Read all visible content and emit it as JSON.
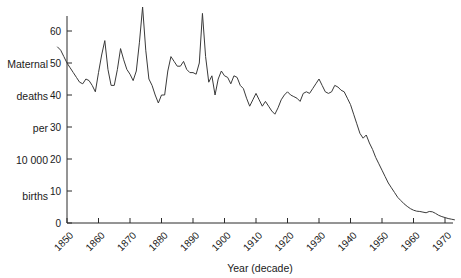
{
  "chart_data": {
    "type": "line",
    "title": "",
    "xlabel": "Year (decade)",
    "ylabel": "Maternal deaths per 10 000 births",
    "ylabel_lines": [
      "Maternal",
      "deaths",
      "per",
      "10 000",
      "births"
    ],
    "xlim": [
      1847,
      1973
    ],
    "ylim": [
      0,
      68
    ],
    "grid": false,
    "legend": "none",
    "line_color": "#3a3a3a",
    "axis_color": "#2b2b2b",
    "xticks": [
      1850,
      1860,
      1870,
      1880,
      1890,
      1900,
      1910,
      1920,
      1930,
      1940,
      1950,
      1960,
      1970
    ],
    "xtick_labels": [
      "1850",
      "1860",
      "1870",
      "1880",
      "1890",
      "1900",
      "1910",
      "1920",
      "1930",
      "1940",
      "1950",
      "1960",
      "1970"
    ],
    "xtick_rotation": 45,
    "yticks": [
      0,
      10,
      20,
      30,
      40,
      50,
      60
    ],
    "ytick_labels": [
      "0",
      "10",
      "20",
      "30",
      "40",
      "50",
      "60"
    ],
    "series": [
      {
        "name": "Maternal deaths per 10 000 births",
        "x": [
          1847,
          1848,
          1849,
          1850,
          1851,
          1852,
          1853,
          1854,
          1855,
          1856,
          1857,
          1858,
          1859,
          1860,
          1861,
          1862,
          1863,
          1864,
          1865,
          1866,
          1867,
          1868,
          1869,
          1870,
          1871,
          1872,
          1873,
          1874,
          1875,
          1876,
          1877,
          1878,
          1879,
          1880,
          1881,
          1882,
          1883,
          1884,
          1885,
          1886,
          1887,
          1888,
          1889,
          1890,
          1891,
          1892,
          1893,
          1894,
          1895,
          1896,
          1897,
          1898,
          1899,
          1900,
          1901,
          1902,
          1903,
          1904,
          1905,
          1906,
          1907,
          1908,
          1909,
          1910,
          1911,
          1912,
          1913,
          1914,
          1915,
          1916,
          1917,
          1918,
          1919,
          1920,
          1921,
          1922,
          1923,
          1924,
          1925,
          1926,
          1927,
          1928,
          1929,
          1930,
          1931,
          1932,
          1933,
          1934,
          1935,
          1936,
          1937,
          1938,
          1939,
          1940,
          1941,
          1942,
          1943,
          1944,
          1945,
          1946,
          1947,
          1948,
          1949,
          1950,
          1951,
          1952,
          1953,
          1954,
          1955,
          1956,
          1957,
          1958,
          1959,
          1960,
          1961,
          1962,
          1963,
          1964,
          1965,
          1966,
          1967,
          1968,
          1969,
          1970,
          1971,
          1972,
          1973
        ],
        "values": [
          55.0,
          54.0,
          52.0,
          50.0,
          48.5,
          47.0,
          45.5,
          44.0,
          43.5,
          45.0,
          44.5,
          43.0,
          41.0,
          47.0,
          52.5,
          57.0,
          48.0,
          43.0,
          43.0,
          48.0,
          54.5,
          51.0,
          48.0,
          46.5,
          44.5,
          47.5,
          56.5,
          67.5,
          54.0,
          45.0,
          43.0,
          40.0,
          37.5,
          40.0,
          40.0,
          47.5,
          52.0,
          50.5,
          49.0,
          49.0,
          50.5,
          48.0,
          47.0,
          47.0,
          46.5,
          50.0,
          65.5,
          52.0,
          44.0,
          46.0,
          40.0,
          45.0,
          47.5,
          46.0,
          45.5,
          43.5,
          46.0,
          45.5,
          43.0,
          42.0,
          39.0,
          36.5,
          38.5,
          40.5,
          38.5,
          36.5,
          38.0,
          36.5,
          35.0,
          34.0,
          36.0,
          38.5,
          40.0,
          41.0,
          40.0,
          39.5,
          39.0,
          38.0,
          40.5,
          41.0,
          40.5,
          42.0,
          43.5,
          45.0,
          43.0,
          41.0,
          40.5,
          41.0,
          43.0,
          42.5,
          41.5,
          41.0,
          39.0,
          37.0,
          34.0,
          31.0,
          28.0,
          26.5,
          27.5,
          25.0,
          23.0,
          20.5,
          18.5,
          16.5,
          14.5,
          12.5,
          11.0,
          9.5,
          8.0,
          7.0,
          6.0,
          5.2,
          4.5,
          4.0,
          3.7,
          3.6,
          3.4,
          3.2,
          3.6,
          3.5,
          3.0,
          2.4,
          2.0,
          1.7,
          1.4,
          1.2,
          1.0
        ]
      }
    ]
  },
  "plot": {
    "origin_x": 67,
    "origin_y": 223,
    "px_per_decade": 31.5,
    "px_per_ten_units": 32.0,
    "axis_right_x": 453,
    "axis_top_y": 16
  }
}
